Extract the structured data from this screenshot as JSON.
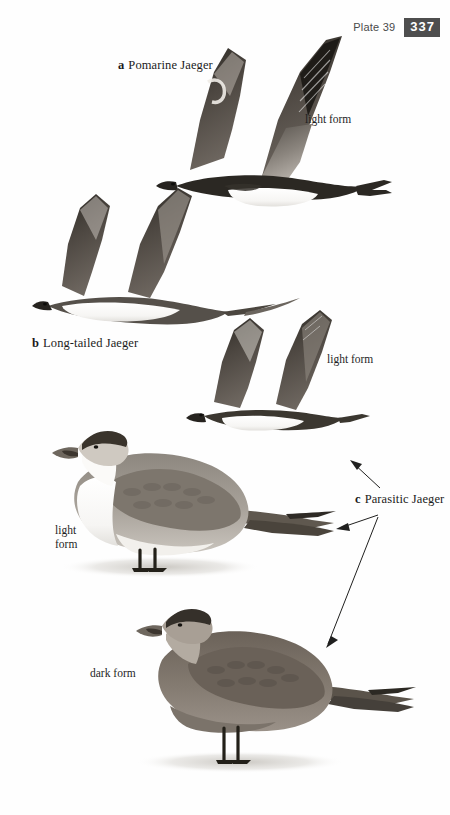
{
  "header": {
    "plate_label": "Plate 39",
    "page_number": "337",
    "badge_color": "#4e4e4e",
    "badge_text_color": "#ffffff"
  },
  "page": {
    "background_color": "#ffffff",
    "ink_color": "#1b1b1b",
    "type": "field-guide-plate"
  },
  "captions": [
    {
      "key": "a",
      "name": "Pomarine Jaeger"
    },
    {
      "key": "b",
      "name": "Long-tailed Jaeger"
    },
    {
      "key": "c",
      "name": "Parasitic Jaeger"
    }
  ],
  "form_labels": {
    "pomarine_flight": "light form",
    "parasitic_flight": "light form",
    "parasitic_standing_light_line1": "light",
    "parasitic_standing_light_line2": "form",
    "parasitic_standing_dark": "dark form"
  },
  "figures": [
    {
      "id": "pomarine-flight",
      "species": "Pomarine Jaeger",
      "pose": "flying",
      "morph": "light form",
      "plumage": "dark upperwings, white belly, dark breast band, blunt twisted central tail feathers"
    },
    {
      "id": "longtailed-flight",
      "species": "Long-tailed Jaeger",
      "pose": "flying",
      "morph": "light form",
      "plumage": "gray-brown upperwings, white underparts, very long slender tail streamers"
    },
    {
      "id": "parasitic-flight",
      "species": "Parasitic Jaeger",
      "pose": "flying",
      "morph": "light form",
      "plumage": "dark upperwings with pale flash, white belly, pointed central tail feathers"
    },
    {
      "id": "parasitic-standing-light",
      "species": "Parasitic Jaeger",
      "pose": "standing",
      "morph": "light form",
      "plumage": "dark cap, white neck and underparts, gray-brown mantle, dark legs"
    },
    {
      "id": "parasitic-standing-dark",
      "species": "Parasitic Jaeger",
      "pose": "standing",
      "morph": "dark form",
      "plumage": "uniform dark brown body, paler face, dark cap and legs"
    }
  ],
  "leader_arrows": [
    {
      "from": "c Parasitic Jaeger",
      "to": "parasitic-flight",
      "direction": "up-left"
    },
    {
      "from": "c Parasitic Jaeger",
      "to": "parasitic-standing-light",
      "direction": "left"
    },
    {
      "from": "c Parasitic Jaeger",
      "to": "parasitic-standing-dark",
      "direction": "down-left"
    }
  ]
}
